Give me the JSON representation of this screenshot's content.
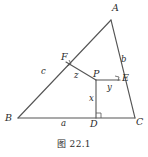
{
  "figure": {
    "caption": "图 22.1",
    "canvas": {
      "width": 148,
      "height": 157
    },
    "stroke_color": "#555555",
    "text_color": "#2b2b2b",
    "background_color": "#ffffff",
    "vertices": [
      {
        "id": "A",
        "label": "A",
        "x": 111,
        "y": 20,
        "label_x": 112,
        "label_y": 3
      },
      {
        "id": "B",
        "label": "B",
        "x": 18,
        "y": 118,
        "label_x": 5,
        "label_y": 115
      },
      {
        "id": "C",
        "label": "C",
        "x": 135,
        "y": 118,
        "label_x": 136,
        "label_y": 119
      },
      {
        "id": "D",
        "label": "D",
        "x": 96,
        "y": 118,
        "label_x": 90,
        "label_y": 120
      },
      {
        "id": "E",
        "label": "E",
        "x": 120,
        "y": 80,
        "label_x": 122,
        "label_y": 74
      },
      {
        "id": "F",
        "label": "F",
        "x": 66,
        "y": 62,
        "label_x": 62,
        "label_y": 53
      },
      {
        "id": "P",
        "label": "P",
        "x": 96,
        "y": 80,
        "label_x": 93,
        "label_y": 70
      }
    ],
    "segments": [
      {
        "id": "AB",
        "from": "A",
        "to": "B",
        "kind": "triangle-side"
      },
      {
        "id": "BC",
        "from": "B",
        "to": "C",
        "kind": "triangle-side"
      },
      {
        "id": "CA",
        "from": "C",
        "to": "A",
        "kind": "triangle-side"
      },
      {
        "id": "PD",
        "from": "P",
        "to": "D",
        "kind": "cevian",
        "label": "x"
      },
      {
        "id": "PE",
        "from": "P",
        "to": "E",
        "kind": "cevian",
        "label": "y"
      },
      {
        "id": "PF",
        "from": "P",
        "to": "F",
        "kind": "cevian",
        "label": "z"
      }
    ],
    "segment_labels": [
      {
        "id": "x",
        "text": "x",
        "label_x": 89,
        "label_y": 97
      },
      {
        "id": "y",
        "text": "y",
        "label_x": 108,
        "label_y": 84
      },
      {
        "id": "z",
        "text": "z",
        "label_x": 75,
        "label_y": 72
      },
      {
        "id": "a",
        "text": "a",
        "label_x": 61,
        "label_y": 120
      },
      {
        "id": "b",
        "text": "b",
        "label_x": 121,
        "label_y": 57
      },
      {
        "id": "c",
        "text": "c",
        "label_x": 42,
        "label_y": 69
      }
    ],
    "right_angle_marks": [
      {
        "id": "mark-at-D",
        "at": "D",
        "size": 4
      },
      {
        "id": "mark-at-E",
        "at": "E",
        "size": 4
      },
      {
        "id": "mark-at-F",
        "at": "F",
        "size": 4
      }
    ]
  }
}
